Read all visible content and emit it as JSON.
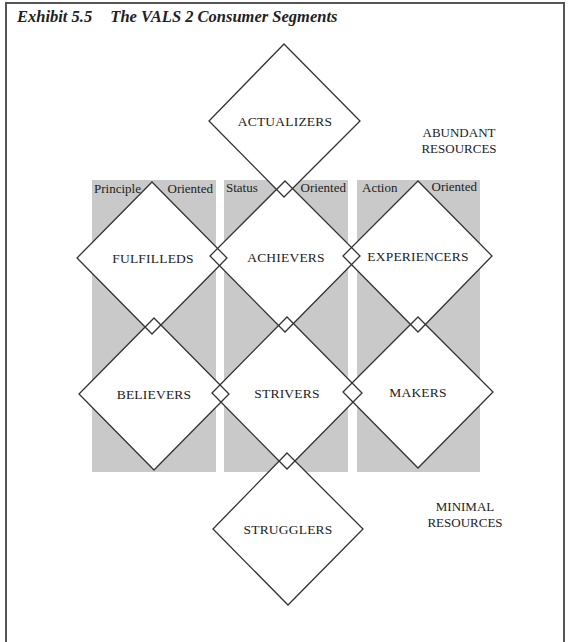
{
  "exhibit": {
    "number": "Exhibit 5.5",
    "title": "The VALS 2 Consumer Segments"
  },
  "columns": [
    {
      "left": "Principle",
      "right": "Oriented"
    },
    {
      "left": "Status",
      "right": "Oriented"
    },
    {
      "left": "Action",
      "right": "Oriented"
    }
  ],
  "segments": {
    "top": "ACTUALIZERS",
    "row1": [
      "FULFILLEDS",
      "ACHIEVERS",
      "EXPERIENCERS"
    ],
    "row2": [
      "BELIEVERS",
      "STRIVERS",
      "MAKERS"
    ],
    "bottom": "STRUGGLERS"
  },
  "resources": {
    "abundant": [
      "ABUNDANT",
      "RESOURCES"
    ],
    "minimal": [
      "MINIMAL",
      "RESOURCES"
    ]
  },
  "colors": {
    "column_fill": "#c9c9c9",
    "line": "#333333",
    "frame": "#555555"
  }
}
